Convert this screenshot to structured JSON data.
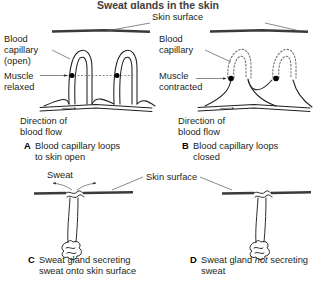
{
  "figure": {
    "title_partial": "Sweat glands in the skin",
    "background_color": "#ffffff",
    "ink_color": "#231f20",
    "skin_line_color": "#3a3a3a",
    "dotted_capillary_color": "#6e6e6e"
  },
  "shared_labels": {
    "skin_surface_top": "Skin surface",
    "skin_surface_bottom": "Skin surface"
  },
  "panels": [
    {
      "id": "A",
      "letter": "A",
      "caption_lines": [
        "Blood capillary loops",
        "to skin open"
      ],
      "labels": {
        "capillary_line1": "Blood",
        "capillary_line2": "capillary",
        "capillary_line3": "(open)",
        "muscle_line1": "Muscle",
        "muscle_line2": "relaxed",
        "flow_line1": "Direction of",
        "flow_line2": "blood flow"
      },
      "state": "capillary loops open, muscle relaxed, loops drawn solid"
    },
    {
      "id": "B",
      "letter": "B",
      "caption_lines": [
        "Blood capillary loops",
        "closed"
      ],
      "labels": {
        "capillary_line1": "Blood",
        "capillary_line2": "capillary",
        "muscle_line1": "Muscle",
        "muscle_line2": "contracted",
        "flow_line1": "Direction of",
        "flow_line2": "blood flow"
      },
      "state": "capillary loops closed, muscle contracted, loops drawn dotted"
    },
    {
      "id": "C",
      "letter": "C",
      "caption_lines": [
        "Sweat gland secreting",
        "sweat onto skin surface"
      ],
      "labels": {
        "sweat": "Sweat"
      },
      "state": "sweat gland secreting, two diverging sweat arrows at pore"
    },
    {
      "id": "D",
      "letter": "D",
      "caption_prefix": "Sweat gland ",
      "caption_emphasis": "not",
      "caption_suffix": " secreting",
      "caption_line2": "sweat",
      "labels": {},
      "state": "sweat gland not secreting, no sweat arrows"
    }
  ]
}
